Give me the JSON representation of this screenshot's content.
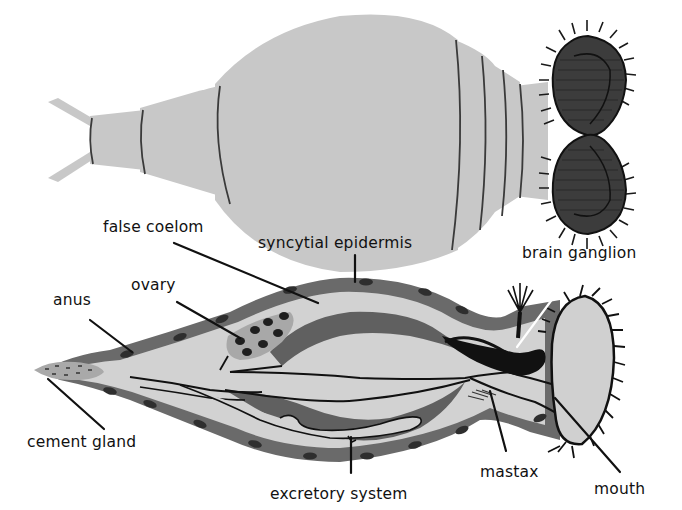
{
  "figure": {
    "panels": [
      {
        "id": "external-view",
        "description": "External dorsal view of a rotifer with forked foot, segmented trunk and ciliated corona"
      },
      {
        "id": "sectional-view",
        "description": "Longitudinal section of a rotifer showing internal anatomy"
      }
    ]
  },
  "labels": {
    "false_coelom": "false coelom",
    "syncytial_epidermis": "syncytial epidermis",
    "brain_ganglion": "brain ganglion",
    "ovary": "ovary",
    "anus": "anus",
    "cement_gland": "cement gland",
    "excretory_system": "excretory system",
    "mastax": "mastax",
    "mouth": "mouth"
  },
  "colors": {
    "background": "#ffffff",
    "body_fill": "#c9c9c9",
    "body_light": "#d8d8d8",
    "tissue_dark": "#6a6a6a",
    "ink": "#111111"
  }
}
